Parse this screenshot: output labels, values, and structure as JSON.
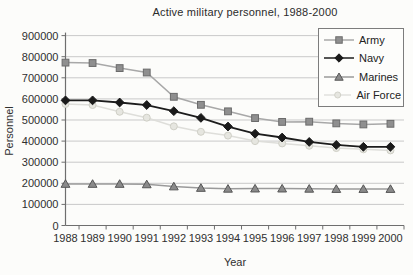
{
  "chart_data": {
    "type": "line",
    "title": "Active military personnel, 1988-2000",
    "xlabel": "Year",
    "ylabel": "Personnel",
    "x": [
      1988,
      1989,
      1990,
      1991,
      1992,
      1993,
      1994,
      1995,
      1996,
      1997,
      1998,
      1999,
      2000
    ],
    "ylim": [
      0,
      900000
    ],
    "ytick_step": 100000,
    "grid": true,
    "legend_position": "top-right",
    "background_color": "#fcfcfa",
    "gridline_color": "#c9c9c9",
    "axis_color": "#6e6e6e",
    "series": [
      {
        "name": "Army",
        "marker": "square",
        "color": "#8f8f8f",
        "edge_color": "#6b6b6b",
        "line_color": "#a8a8a8",
        "values": [
          772000,
          770000,
          746000,
          725000,
          610000,
          572000,
          541000,
          509000,
          491000,
          492000,
          484000,
          479000,
          482000
        ]
      },
      {
        "name": "Navy",
        "marker": "diamond",
        "color": "#1a1a1a",
        "edge_color": "#1a1a1a",
        "line_color": "#1c1c1c",
        "values": [
          593000,
          593000,
          583000,
          571000,
          542000,
          510000,
          469000,
          435000,
          417000,
          396000,
          382000,
          373000,
          373000
        ]
      },
      {
        "name": "Marines",
        "marker": "triangle",
        "color": "#8a8a8a",
        "edge_color": "#565656",
        "line_color": "#9a9a9a",
        "values": [
          197000,
          197000,
          197000,
          195000,
          185000,
          178000,
          174000,
          175000,
          175000,
          174000,
          173000,
          173000,
          173000
        ]
      },
      {
        "name": "Air Force",
        "marker": "circle",
        "color": "#e6e6e0",
        "edge_color": "#cfcfc6",
        "line_color": "#dededa",
        "values": [
          576000,
          571000,
          539000,
          511000,
          470000,
          444000,
          426000,
          400000,
          389000,
          378000,
          367000,
          361000,
          356000
        ]
      }
    ]
  }
}
